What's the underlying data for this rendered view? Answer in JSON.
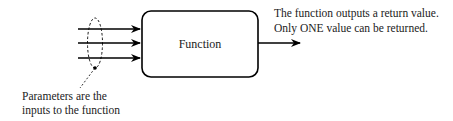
{
  "diagram": {
    "function_box": {
      "label": "Function"
    },
    "inputs": {
      "count": 3
    },
    "output_note": {
      "line1": "The function outputs a return value.",
      "line2": "Only ONE value can be returned."
    },
    "parameters_note": {
      "line1": "Parameters are the",
      "line2": "inputs to the function"
    },
    "colors": {
      "stroke": "#000000",
      "text": "#222222",
      "background": "#ffffff"
    }
  }
}
